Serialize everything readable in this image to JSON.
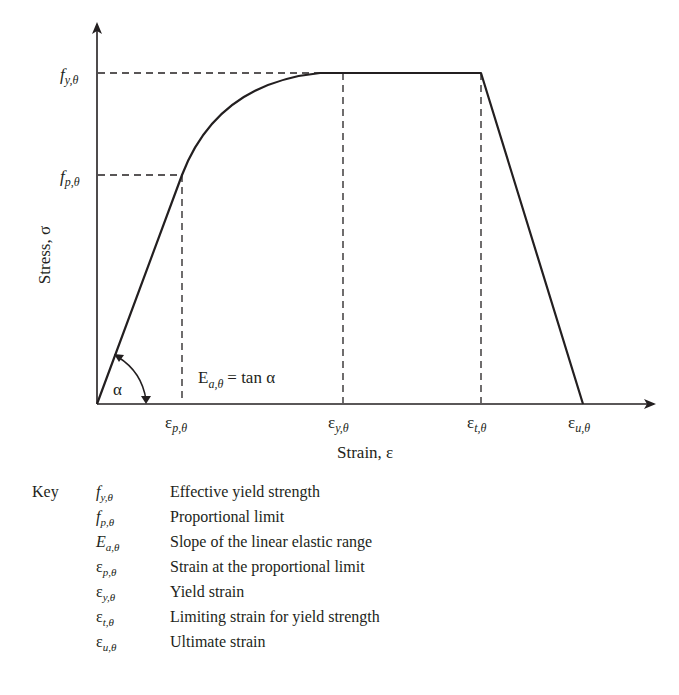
{
  "diagram": {
    "type": "stress-strain curve",
    "y_axis": {
      "label": "Stress, σ"
    },
    "x_axis": {
      "label": "Strain, ε"
    },
    "y_ticks": [
      {
        "id": "fy",
        "main": "f",
        "sub": "y,θ"
      },
      {
        "id": "fp",
        "main": "f",
        "sub": "p,θ"
      }
    ],
    "x_ticks": [
      {
        "id": "ep",
        "main": "ε",
        "sub": "p,θ"
      },
      {
        "id": "ey",
        "main": "ε",
        "sub": "y,θ"
      },
      {
        "id": "et",
        "main": "ε",
        "sub": "t,θ"
      },
      {
        "id": "eu",
        "main": "ε",
        "sub": "u,θ"
      }
    ],
    "angle_label": "α",
    "slope_annotation": {
      "lhs_main": "E",
      "lhs_sub": "a,θ",
      "rhs": "= tan α"
    },
    "segments": [
      {
        "name": "linear elastic",
        "from": "origin",
        "to": "(ε_p,θ, f_p,θ)",
        "shape": "line"
      },
      {
        "name": "elliptical transition",
        "from": "(ε_p,θ, f_p,θ)",
        "to": "(ε_y,θ, f_y,θ)",
        "shape": "curve"
      },
      {
        "name": "yield plateau",
        "from": "(ε_y,θ, f_y,θ)",
        "to": "(ε_t,θ, f_y,θ)",
        "shape": "line"
      },
      {
        "name": "linear descending",
        "from": "(ε_t,θ, f_y,θ)",
        "to": "(ε_u,θ, 0)",
        "shape": "line"
      }
    ]
  },
  "key": {
    "title": "Key",
    "items": [
      {
        "main": "f",
        "sub": "y,θ",
        "greek": false,
        "description": "Effective yield strength"
      },
      {
        "main": "f",
        "sub": "p,θ",
        "greek": false,
        "description": "Proportional limit"
      },
      {
        "main": "E",
        "sub": "a,θ",
        "greek": false,
        "description": "Slope of the linear elastic range"
      },
      {
        "main": "ε",
        "sub": "p,θ",
        "greek": true,
        "description": "Strain at the proportional limit"
      },
      {
        "main": "ε",
        "sub": "y,θ",
        "greek": true,
        "description": "Yield strain"
      },
      {
        "main": "ε",
        "sub": "t,θ",
        "greek": true,
        "description": "Limiting strain for yield strength"
      },
      {
        "main": "ε",
        "sub": "u,θ",
        "greek": true,
        "description": "Ultimate strain"
      }
    ]
  }
}
